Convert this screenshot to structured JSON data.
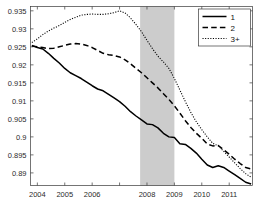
{
  "chart_data": {
    "type": "line",
    "title": "",
    "xlabel": "",
    "ylabel": "",
    "xlim": [
      2003.75,
      2011.85
    ],
    "ylim": [
      0.8865,
      0.9362
    ],
    "grid": false,
    "legend_position": "top-right",
    "xticks": [
      2004,
      2005,
      2006,
      2007,
      2008,
      2009,
      2010,
      2011
    ],
    "xticklabels": [
      "2004",
      "2005",
      "2006",
      "",
      "2008",
      "2009",
      "2010",
      "2011"
    ],
    "yticks": [
      0.89,
      0.895,
      0.9,
      0.905,
      0.91,
      0.915,
      0.92,
      0.925,
      0.93,
      0.935
    ],
    "yticklabels": [
      "0.89",
      "0.895",
      "0.9",
      "0.905",
      "0.91",
      "0.915",
      "0.92",
      "0.925",
      "0.93",
      "0.935"
    ],
    "shaded_regions": [
      {
        "name": "recession-band",
        "x_start": 2007.75,
        "x_end": 2009.0,
        "color": "#cccccc"
      }
    ],
    "series": [
      {
        "name": "1",
        "style": "solid",
        "color": "#000000",
        "linewidth": 1.5,
        "x": [
          2003.8,
          2004.0,
          2004.2,
          2004.4,
          2004.6,
          2004.8,
          2005.0,
          2005.2,
          2005.4,
          2005.6,
          2005.8,
          2006.0,
          2006.2,
          2006.4,
          2006.6,
          2006.8,
          2007.0,
          2007.2,
          2007.4,
          2007.6,
          2007.8,
          2008.0,
          2008.2,
          2008.4,
          2008.6,
          2008.8,
          2009.0,
          2009.2,
          2009.4,
          2009.6,
          2009.8,
          2010.0,
          2010.2,
          2010.4,
          2010.6,
          2010.8,
          2011.0,
          2011.2,
          2011.4,
          2011.6,
          2011.8
        ],
        "y": [
          0.9254,
          0.9248,
          0.9244,
          0.9232,
          0.9218,
          0.9205,
          0.919,
          0.9178,
          0.917,
          0.9162,
          0.9152,
          0.9142,
          0.9133,
          0.9128,
          0.9118,
          0.9108,
          0.9098,
          0.9085,
          0.907,
          0.9058,
          0.9047,
          0.9036,
          0.9034,
          0.9025,
          0.901,
          0.9,
          0.8998,
          0.8981,
          0.8979,
          0.8968,
          0.8955,
          0.8938,
          0.8922,
          0.8915,
          0.892,
          0.8915,
          0.8905,
          0.8895,
          0.8885,
          0.8874,
          0.8869
        ]
      },
      {
        "name": "2",
        "style": "dashed",
        "color": "#000000",
        "linewidth": 1.5,
        "x": [
          2003.8,
          2004.0,
          2004.2,
          2004.4,
          2004.6,
          2004.8,
          2005.0,
          2005.2,
          2005.4,
          2005.6,
          2005.8,
          2006.0,
          2006.2,
          2006.4,
          2006.6,
          2006.8,
          2007.0,
          2007.2,
          2007.4,
          2007.6,
          2007.8,
          2008.0,
          2008.2,
          2008.4,
          2008.6,
          2008.8,
          2009.0,
          2009.2,
          2009.4,
          2009.6,
          2009.8,
          2010.0,
          2010.2,
          2010.4,
          2010.6,
          2010.8,
          2011.0,
          2011.2,
          2011.4,
          2011.6,
          2011.8
        ],
        "y": [
          0.9252,
          0.925,
          0.9248,
          0.9245,
          0.9246,
          0.925,
          0.9254,
          0.9258,
          0.9259,
          0.9258,
          0.9254,
          0.9248,
          0.924,
          0.9232,
          0.9228,
          0.9226,
          0.9222,
          0.9214,
          0.9203,
          0.919,
          0.9178,
          0.9164,
          0.915,
          0.9136,
          0.912,
          0.9104,
          0.9086,
          0.9066,
          0.9045,
          0.9026,
          0.901,
          0.8996,
          0.898,
          0.8975,
          0.8976,
          0.8964,
          0.8952,
          0.8938,
          0.8926,
          0.8915,
          0.8911
        ]
      },
      {
        "name": "3+",
        "style": "dotted",
        "color": "#000000",
        "linewidth": 1.1,
        "x": [
          2003.8,
          2004.0,
          2004.2,
          2004.4,
          2004.6,
          2004.8,
          2005.0,
          2005.2,
          2005.4,
          2005.6,
          2005.8,
          2006.0,
          2006.2,
          2006.4,
          2006.6,
          2006.8,
          2007.0,
          2007.2,
          2007.4,
          2007.6,
          2007.8,
          2008.0,
          2008.2,
          2008.4,
          2008.6,
          2008.8,
          2009.0,
          2009.2,
          2009.4,
          2009.6,
          2009.8,
          2010.0,
          2010.2,
          2010.4,
          2010.6,
          2010.8,
          2011.0,
          2011.2,
          2011.4,
          2011.6,
          2011.8
        ],
        "y": [
          0.9262,
          0.9272,
          0.9284,
          0.9294,
          0.9302,
          0.9309,
          0.9318,
          0.9326,
          0.9332,
          0.9338,
          0.934,
          0.9341,
          0.934,
          0.934,
          0.9342,
          0.9345,
          0.935,
          0.9344,
          0.933,
          0.9312,
          0.9292,
          0.9268,
          0.9245,
          0.9224,
          0.9208,
          0.919,
          0.9162,
          0.913,
          0.9098,
          0.9068,
          0.9042,
          0.902,
          0.9,
          0.8982,
          0.8975,
          0.896,
          0.8944,
          0.8928,
          0.8912,
          0.8898,
          0.8888
        ]
      }
    ],
    "legend": [
      {
        "label": "1",
        "style": "solid"
      },
      {
        "label": "2",
        "style": "dashed"
      },
      {
        "label": "3+",
        "style": "dotted"
      }
    ]
  }
}
